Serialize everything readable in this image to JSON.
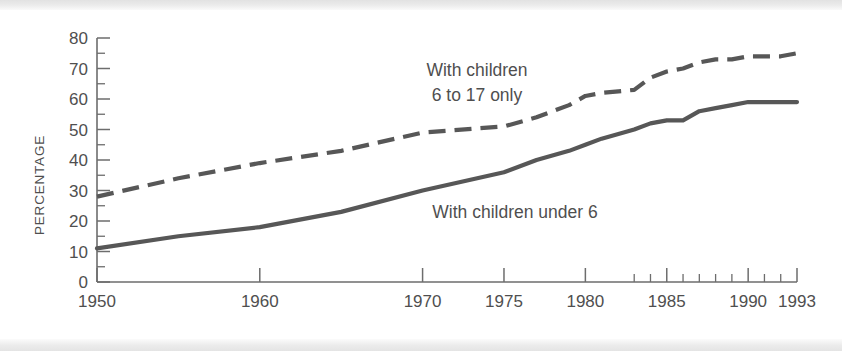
{
  "figure": {
    "ylabel": "PERCENTAGE",
    "annotations": [
      {
        "line1": "With children",
        "line2": "6 to 17 only"
      },
      {
        "line1": "With children under 6",
        "line2": ""
      }
    ]
  },
  "colors": {
    "line": "#575757",
    "axis": "#6d6d6d",
    "text": "#4f4f4f",
    "background": "#ffffff",
    "page_edge": "#e8e8e8"
  },
  "chart_data": {
    "type": "line",
    "title": "",
    "xlabel": "",
    "ylabel": "PERCENTAGE",
    "xlim": [
      1950,
      1993
    ],
    "ylim": [
      0,
      80
    ],
    "grid": false,
    "legend": "inline-annotations",
    "ytick_labels": [
      "0",
      "10",
      "20",
      "30",
      "40",
      "50",
      "60",
      "70",
      "80"
    ],
    "yticks": [
      0,
      10,
      20,
      30,
      40,
      50,
      60,
      70,
      80
    ],
    "yticks_minor": [
      5,
      15,
      25,
      35,
      45,
      55,
      65,
      75
    ],
    "xtick_labels": [
      "1950",
      "1960",
      "1970",
      "1975",
      "1980",
      "1985",
      "1990",
      "1993"
    ],
    "xticks": [
      1950,
      1960,
      1970,
      1975,
      1980,
      1985,
      1990,
      1993
    ],
    "xticks_minor": [
      1983,
      1984,
      1986,
      1987,
      1988,
      1989,
      1991,
      1992
    ],
    "series": [
      {
        "name": "With children 6 to 17 only",
        "style": "dashed",
        "x": [
          1950,
          1955,
          1960,
          1965,
          1970,
          1975,
          1977,
          1979,
          1980,
          1981,
          1983,
          1984,
          1985,
          1986,
          1987,
          1988,
          1989,
          1990,
          1991,
          1992,
          1993
        ],
        "values": [
          28,
          34,
          39,
          43,
          49,
          51,
          54,
          58,
          61,
          62,
          63,
          67,
          69,
          70,
          72,
          73,
          73,
          74,
          74,
          74,
          75
        ]
      },
      {
        "name": "With children under 6",
        "style": "solid",
        "x": [
          1950,
          1955,
          1960,
          1965,
          1970,
          1975,
          1977,
          1979,
          1980,
          1981,
          1983,
          1984,
          1985,
          1986,
          1987,
          1988,
          1989,
          1990,
          1991,
          1992,
          1993
        ],
        "values": [
          11,
          15,
          18,
          23,
          30,
          36,
          40,
          43,
          45,
          47,
          50,
          52,
          53,
          53,
          56,
          57,
          58,
          59,
          59,
          59,
          59
        ]
      }
    ]
  }
}
